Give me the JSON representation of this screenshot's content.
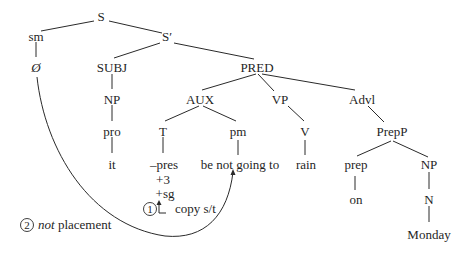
{
  "diagram": {
    "type": "syntax-tree",
    "nodes": {
      "S": "S",
      "sm": "sm",
      "S_prime": "S′",
      "null": "Ø",
      "SUBJ": "SUBJ",
      "PRED": "PRED",
      "NP_subj": "NP",
      "AUX": "AUX",
      "VP": "VP",
      "Advl": "Advl",
      "pro": "pro",
      "T": "T",
      "pm": "pm",
      "V": "V",
      "PrepP": "PrepP",
      "it": "it",
      "pres": "–pres",
      "plus3": "+3",
      "plussg": "+sg",
      "pm_words": "be not going to",
      "rain": "rain",
      "prep": "prep",
      "NP_obj": "NP",
      "on": "on",
      "N": "N",
      "Monday": "Monday"
    },
    "annotations": {
      "step1_number": "1",
      "step1_label": "copy s/t",
      "step2_number": "2",
      "step2_italic": "not",
      "step2_label": " placement"
    }
  }
}
